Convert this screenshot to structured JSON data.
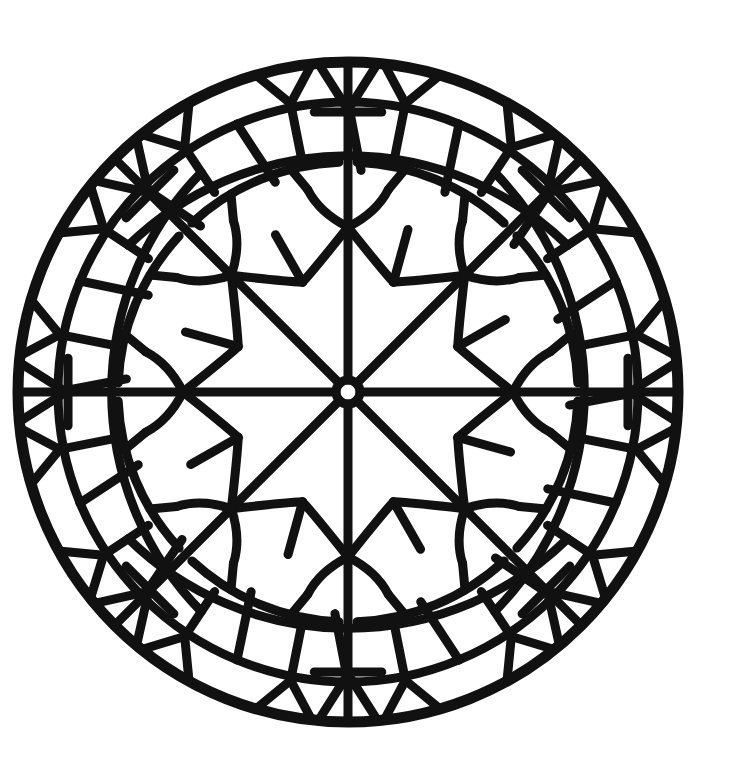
{
  "image": {
    "kind": "mandala coloring page",
    "description": "Black line-art circular stained-glass style mandala with 8-fold symmetry on white background",
    "background": "#ffffff",
    "ink": "#111111"
  },
  "geometry": {
    "center": [
      348,
      392
    ],
    "outer_radius": 330,
    "stroke_width": 9,
    "spokes": 8,
    "center_ring_radius": 12,
    "star_points": 8,
    "inner_star_radius": 165,
    "star_notch_radius": 95,
    "mid_ring_radius": 230,
    "outer_cell_ring_radius": 290
  }
}
